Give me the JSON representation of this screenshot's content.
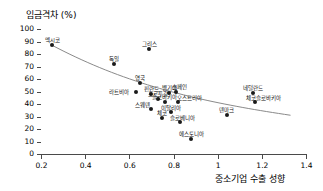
{
  "chart_data": {
    "type": "scatter",
    "title": "",
    "ylabel": "임금격차 (%)",
    "xlabel": "중소기업 수출 성향",
    "xlim": [
      0.2,
      1.4
    ],
    "ylim": [
      0,
      100
    ],
    "xticks": [
      "0.2",
      "0.4",
      "0.6",
      "0.8",
      "1",
      "1.2",
      "1.4"
    ],
    "xtick_values": [
      0.2,
      0.4,
      0.6,
      0.8,
      1.0,
      1.2,
      1.4
    ],
    "yticks": [
      "0",
      "10",
      "20",
      "30",
      "40",
      "50",
      "60",
      "70",
      "80",
      "90",
      "100"
    ],
    "ytick_values": [
      0,
      10,
      20,
      30,
      40,
      50,
      60,
      70,
      80,
      90,
      100
    ],
    "grid": false,
    "legend": "none",
    "point_color": "#1a1a1a",
    "trendline_color": "#8a8a8a",
    "trendline": {
      "present": true,
      "shape": "decreasing-curve",
      "x_start": 0.25,
      "y_start": 87,
      "x_end": 1.33,
      "y_end": 31
    },
    "points": [
      {
        "label": "멕시코",
        "x": 0.25,
        "y": 87,
        "label_dx": 0,
        "label_dy": -7
      },
      {
        "label": "독일",
        "x": 0.53,
        "y": 72,
        "label_dx": 0,
        "label_dy": -7
      },
      {
        "label": "그리스",
        "x": 0.69,
        "y": 84,
        "label_dx": 0,
        "label_dy": -7
      },
      {
        "label": "영국",
        "x": 0.65,
        "y": 57,
        "label_dx": 0,
        "label_dy": -7
      },
      {
        "label": "라트비아",
        "x": 0.63,
        "y": 50,
        "label_dx": -17,
        "label_dy": -2
      },
      {
        "label": "핀란드",
        "x": 0.7,
        "y": 48,
        "label_dx": 0,
        "label_dy": -7
      },
      {
        "label": "포르투갈",
        "x": 0.73,
        "y": 44,
        "label_dx": 0,
        "label_dy": -7
      },
      {
        "label": "벨기에",
        "x": 0.78,
        "y": 49,
        "label_dx": 0,
        "label_dy": -7
      },
      {
        "label": "스페인",
        "x": 0.81,
        "y": 50,
        "label_dx": 4,
        "label_dy": -7
      },
      {
        "label": "슬로바키아",
        "x": 0.76,
        "y": 42,
        "label_dx": 0,
        "label_dy": -7
      },
      {
        "label": "오스트리아",
        "x": 0.82,
        "y": 42,
        "label_dx": 12,
        "label_dy": -6
      },
      {
        "label": "스웨덴",
        "x": 0.7,
        "y": 36,
        "label_dx": -9,
        "label_dy": -6
      },
      {
        "label": "이탈리아",
        "x": 0.79,
        "y": 34,
        "label_dx": 0,
        "label_dy": -6
      },
      {
        "label": "체코",
        "x": 0.75,
        "y": 29,
        "label_dx": 0,
        "label_dy": -7
      },
      {
        "label": "슬로베니아",
        "x": 0.83,
        "y": 26,
        "label_dx": 2,
        "label_dy": -6
      },
      {
        "label": "에스토니아",
        "x": 0.88,
        "y": 12,
        "label_dx": 0,
        "label_dy": -7
      },
      {
        "label": "덴마크",
        "x": 1.04,
        "y": 31,
        "label_dx": 0,
        "label_dy": -7
      },
      {
        "label": "네덜란드",
        "x": 1.16,
        "y": 49,
        "label_dx": 0,
        "label_dy": -7
      },
      {
        "label": "체코슬로바키아",
        "x": 1.17,
        "y": 42,
        "label_dx": 8,
        "label_dy": -6
      }
    ]
  }
}
